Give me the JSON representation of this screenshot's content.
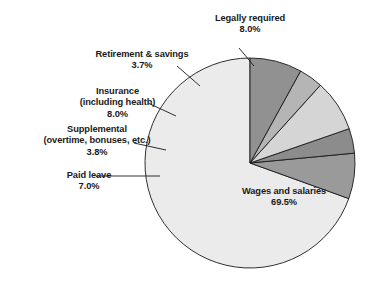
{
  "chart_data": {
    "type": "pie",
    "title": "",
    "subtitle": "",
    "xlabel": "",
    "ylabel": "",
    "legend_position": "none",
    "grid": false,
    "unit": "%",
    "start_angle_deg": 90,
    "direction": "counterclockwise",
    "categories": [
      "Wages and salaries",
      "Paid leave",
      "Supplemental (overtime, bonuses, etc.)",
      "Insurance (including health)",
      "Retirement & savings",
      "Legally required"
    ],
    "values": [
      69.5,
      7.0,
      3.8,
      8.0,
      3.7,
      8.0
    ],
    "colors": [
      "#ebebeb",
      "#9a9a9a",
      "#8c8c8c",
      "#d5d5d5",
      "#b5b5b5",
      "#919191"
    ],
    "slices": [
      {
        "name": "Wages and salaries",
        "value": 69.5,
        "value_label": "69.5%",
        "color": "#ebebeb",
        "label_lines": [
          "Wages and salaries",
          "69.5%"
        ],
        "label_placement": "inside"
      },
      {
        "name": "Paid leave",
        "value": 7.0,
        "value_label": "7.0%",
        "color": "#9a9a9a",
        "label_lines": [
          "Paid leave",
          "7.0%"
        ],
        "label_placement": "outside-left"
      },
      {
        "name": "Supplemental (overtime, bonuses, etc.)",
        "value": 3.8,
        "value_label": "3.8%",
        "color": "#8c8c8c",
        "label_lines": [
          "Supplemental",
          "(overtime, bonuses, etc.)",
          "3.8%"
        ],
        "label_placement": "outside-left"
      },
      {
        "name": "Insurance (including health)",
        "value": 8.0,
        "value_label": "8.0%",
        "color": "#d5d5d5",
        "label_lines": [
          "Insurance",
          "(including health)",
          "8.0%"
        ],
        "label_placement": "outside-left"
      },
      {
        "name": "Retirement & savings",
        "value": 3.7,
        "value_label": "3.7%",
        "color": "#b5b5b5",
        "label_lines": [
          "Retirement & savings",
          "3.7%"
        ],
        "label_placement": "outside-upper-left"
      },
      {
        "name": "Legally required",
        "value": 8.0,
        "value_label": "8.0%",
        "color": "#919191",
        "label_lines": [
          "Legally required",
          "8.0%"
        ],
        "label_placement": "outside-top"
      }
    ]
  },
  "labels": {
    "legally_required": {
      "line1": "Legally required",
      "line2": "8.0%"
    },
    "retirement": {
      "line1": "Retirement & savings",
      "line2": "3.7%"
    },
    "insurance": {
      "line1": "Insurance",
      "line2": "(including health)",
      "line3": "8.0%"
    },
    "supplemental": {
      "line1": "Supplemental",
      "line2": "(overtime, bonuses, etc.)",
      "line3": "3.8%"
    },
    "paid_leave": {
      "line1": "Paid leave",
      "line2": "7.0%"
    },
    "wages": {
      "line1": "Wages and salaries",
      "line2": "69.5%"
    }
  },
  "style": {
    "stroke": "#1a1a1a",
    "background": "#ffffff",
    "text_color": "#1a1a1a"
  },
  "geometry": {
    "cx": 250,
    "cy": 163,
    "r": 105
  }
}
